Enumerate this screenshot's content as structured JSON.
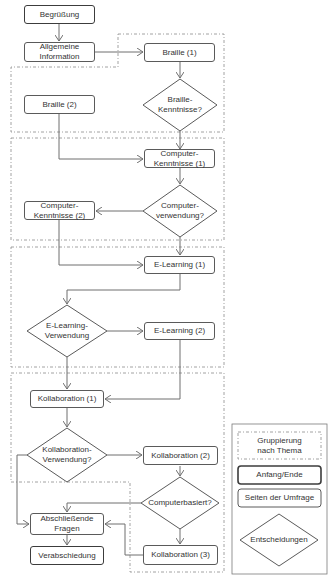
{
  "flowchart": {
    "nodes": {
      "begruessung": "Begrüßung",
      "allgemeine_information": "Allgemeine Information",
      "braille_1": "Braille (1)",
      "braille_kenntnisse": "Braille-Kenntnisse?",
      "braille_2": "Braille (2)",
      "computer_kenntnisse_1": "Computer-Kenntnisse (1)",
      "computerverwendung": "Computer-verwendung?",
      "computer_kenntnisse_2": "Computer-Kenntnisse (2)",
      "elearning_1": "E-Learning (1)",
      "elearning_verwendung": "E-Learning-Verwendung",
      "elearning_2": "E-Learning (2)",
      "kollaboration_1": "Kollaboration (1)",
      "kollaboration_verwendung": "Kollaboration-Verwendung?",
      "kollaboration_2": "Kollaboration (2)",
      "computerbasiert": "Computerbasiert?",
      "abschliessende_fragen": "Abschließende Fragen",
      "verabschiedung": "Verabschiedung",
      "kollaboration_3": "Kollaboration (3)"
    },
    "lines": {
      "braille_kenntnisse_1": "Braille-",
      "braille_kenntnisse_2": "Kenntnisse?",
      "computer_kenntnisse_1a": "Computer-",
      "computer_kenntnisse_1b": "Kenntnisse (1)",
      "computerverwendung_1": "Computer-",
      "computerverwendung_2": "verwendung?",
      "computer_kenntnisse_2a": "Computer-",
      "computer_kenntnisse_2b": "Kenntnisse (2)",
      "elearning_verwendung_1": "E-Learning-",
      "elearning_verwendung_2": "Verwendung",
      "kollaboration_verwendung_1": "Kollaboration-",
      "kollaboration_verwendung_2": "Verwendung?",
      "allgemeine_1": "Allgemeine",
      "allgemeine_2": "Information",
      "abschliessende_1": "Abschließende",
      "abschliessende_2": "Fragen"
    }
  },
  "legend": {
    "grouping_line1": "Gruppierung",
    "grouping_line2": "nach Thema",
    "start_end": "Anfang/Ende",
    "survey_pages": "Seiten der Umfrage",
    "decisions": "Entscheidungen"
  },
  "colors": {
    "line": "#6e6e6e",
    "dashed": "#8a8a8a",
    "terminal_border": "#3c3c3c"
  }
}
